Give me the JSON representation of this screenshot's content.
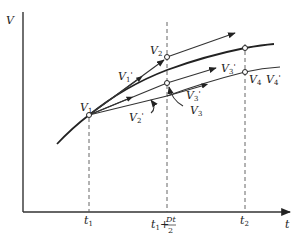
{
  "diagram": {
    "axes": {
      "y_label": "V",
      "x_label": "t",
      "ticks": [
        {
          "label": "t",
          "sub": "1"
        },
        {
          "label": "t",
          "sub": "1",
          "suffix": "+",
          "frac_num": "Dt",
          "frac_den": "2"
        },
        {
          "label": "t",
          "sub": "2"
        }
      ]
    },
    "points": [
      {
        "name": "V",
        "sub": "1"
      },
      {
        "name": "V",
        "sub": "2"
      },
      {
        "name": "V",
        "sub": "3"
      },
      {
        "name": "V",
        "sub": "4"
      }
    ],
    "slope_labels": [
      {
        "name": "V",
        "sub": "1",
        "prime": "'"
      },
      {
        "name": "V",
        "sub": "2",
        "prime": "'"
      },
      {
        "name": "V",
        "sub": "3",
        "prime": "'"
      },
      {
        "name": "V",
        "sub": "3",
        "prime": "'"
      },
      {
        "name": "V",
        "sub": "4",
        "prime": "'"
      }
    ]
  }
}
